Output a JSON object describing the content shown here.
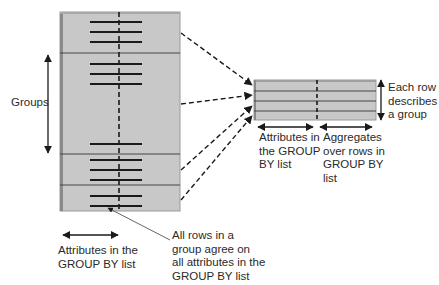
{
  "diagram": {
    "colors": {
      "table_fill": "#c8c8c8",
      "table_edge": "#9a9a9a",
      "line": "#1a1a1a",
      "text": "#2a2a2a"
    },
    "left_table": {
      "x": 60,
      "y": 12,
      "width": 120,
      "height": 199,
      "divider_x": 119,
      "group_boundaries_y": [
        53,
        154,
        185
      ],
      "row_lines_y": [
        22,
        32,
        42,
        64,
        74,
        84,
        144,
        160,
        170,
        180,
        196,
        206
      ],
      "row_line_x1": 90,
      "row_line_x2": 142
    },
    "right_table": {
      "x": 254,
      "y": 80,
      "width": 122,
      "height": 40,
      "divider_x": 317,
      "row_boundaries_y": [
        91,
        101,
        111
      ]
    },
    "labels": {
      "groups": "Groups",
      "left_bottom": "Attributes in the\nGROUP BY list",
      "center_bottom": "All rows in a\ngroup agree on\nall attributes in the\nGROUP BY list",
      "right_attrs": "Attributes in\nthe GROUP\nBY list",
      "right_aggs": "Aggregates\nover rows in\nGROUP BY\nlist",
      "right_side": "Each row\ndescribes\na group"
    }
  }
}
